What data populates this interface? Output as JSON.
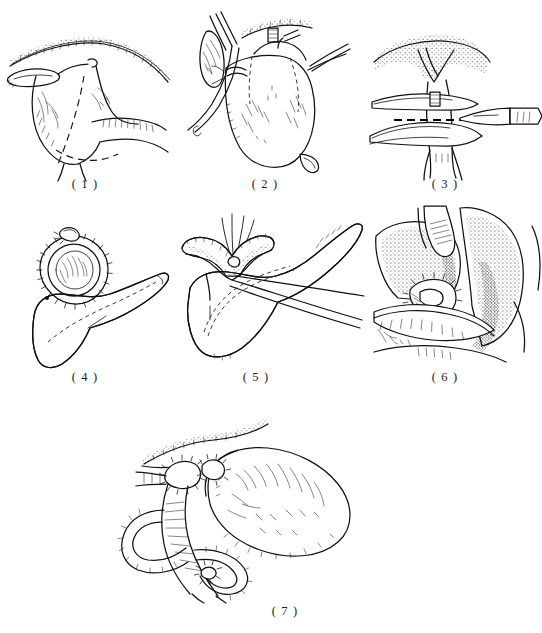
{
  "plate": {
    "title": "Pancreaticoduodenectomy (Whipple procedure) operative sequence",
    "background_color": "#ffffff",
    "ink_color": "#111111",
    "width": 542,
    "height": 633,
    "style": "black-and-white stippled surgical line drawing",
    "panel_count": 7
  },
  "panels": [
    {
      "number": "( 1 )",
      "caption": "( 1 )",
      "name": "panel-1-exposure-and-resection-lines",
      "description": "Liver edge with stippled inferior border above; stomach and duodenum exposed; dashed lines mark the planned lines of transection.",
      "features": [
        "liver-inferior-border",
        "gallbladder",
        "stomach-antrum",
        "duodenum",
        "dashed-resection-line",
        "pancreatic-body"
      ]
    },
    {
      "number": "( 2 )",
      "caption": "( 2 )",
      "name": "panel-2-vascular-control",
      "description": "Anterior view of the stomach with vessels ligated and clamps applied; dotted lines indicate the division plane.",
      "features": [
        "stomach-body",
        "vascular-clamp",
        "ligature",
        "gastric-vessels",
        "dotted-division-line",
        "retractor"
      ]
    },
    {
      "number": "( 3 )",
      "caption": "( 3 )",
      "name": "panel-3-transection-with-scalpel",
      "description": "Close-up of the structure held between two tapes with a heavy dashed incision line and a scalpel approaching from the right.",
      "features": [
        "scalpel",
        "umbilical-tape",
        "dashed-incision-line",
        "stippled-tissue",
        "tubular-structure"
      ]
    },
    {
      "number": "( 4 )",
      "caption": "( 4 )",
      "name": "panel-4-duodenal-stump-closure",
      "description": "Circular sutured stump closed with a running suture ring, knot at the top, attached to the stippled pancreas.",
      "features": [
        "sutured-stump-ring",
        "suture-knot",
        "pancreas-stippled",
        "dashed-duct-line"
      ]
    },
    {
      "number": "( 5 )",
      "caption": "( 5 )",
      "name": "panel-5-pancreaticojejunostomy",
      "description": "Opened jejunal loop held by converging suture threads being anastomosed to the cut end of the pancreas.",
      "features": [
        "pancreas-stippled",
        "opened-jejunal-loop",
        "suture-threads",
        "pancreatic-duct-dashed",
        "traction-suture"
      ]
    },
    {
      "number": "( 6 )",
      "caption": "( 6 )",
      "name": "panel-6-hepaticojejunostomy",
      "description": "Densely stippled liver surface with the bile duct anastomosis completed by interrupted sutures.",
      "features": [
        "liver-stippled",
        "bile-duct",
        "interrupted-sutures",
        "jejunal-limb",
        "hatched-cut-surface"
      ]
    },
    {
      "number": "( 7 )",
      "caption": "( 7 )",
      "name": "panel-7-completed-reconstruction",
      "description": "Final Roux-en-Y reconstruction showing the stomach, gastrojejunostomy and the looped jejunal limbs with suture lines.",
      "features": [
        "stomach",
        "gastrojejunostomy",
        "jejunal-loops",
        "roux-limb",
        "suture-lines",
        "liver-edge-stippled"
      ]
    }
  ],
  "caption_labels": {
    "one": "( 1 )",
    "two": "( 2 )",
    "three": "( 3 )",
    "four": "( 4 )",
    "five": "( 5 )",
    "six": "( 6 )",
    "seven": "( 7 )"
  }
}
